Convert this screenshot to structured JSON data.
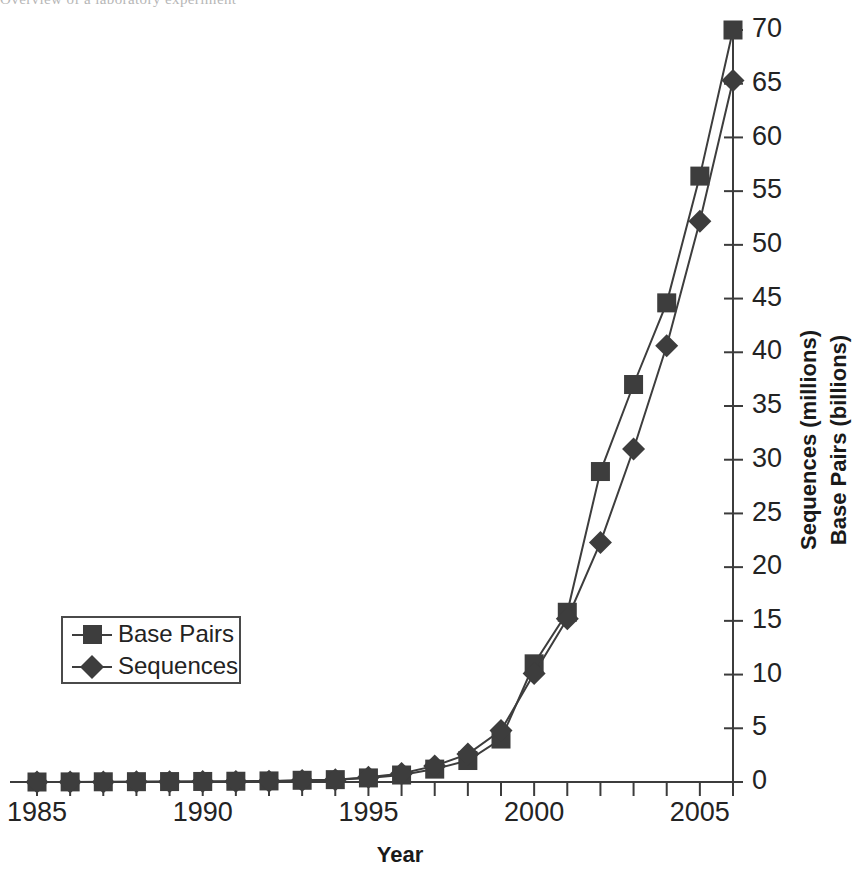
{
  "document_fragment": {
    "clipped_line": "Overview of a laboratory experiment"
  },
  "figure": {
    "name": "genbank-growth-line-chart"
  },
  "axes": {
    "x_title": "Year",
    "y_title_line1": "Sequences (millions)",
    "y_title_line2": "Base Pairs (billions)",
    "x_tick_labels": [
      "1985",
      "1990",
      "1995",
      "2000",
      "2005"
    ],
    "y_tick_labels": [
      "0",
      "5",
      "10",
      "15",
      "20",
      "25",
      "30",
      "35",
      "40",
      "45",
      "50",
      "55",
      "60",
      "65",
      "70"
    ]
  },
  "legend": {
    "position": "inside-lower-left",
    "entries": [
      {
        "label": "Base Pairs",
        "marker": "square-marker",
        "color": "#3d3d3d"
      },
      {
        "label": "Sequences",
        "marker": "diamond-marker",
        "color": "#3d3d3d"
      }
    ]
  },
  "colors": {
    "series": "#3d3d3d",
    "axis": "#3c3c3c",
    "text": "#232323",
    "background": "#ffffff"
  },
  "chart_data": {
    "type": "line",
    "title": "",
    "subtitle": "",
    "xlabel": "Year",
    "ylabel": "Sequences (millions) / Base Pairs (billions)",
    "xlim": [
      1985,
      2006
    ],
    "ylim": [
      0,
      70
    ],
    "y_axis_side": "right",
    "y_tick_step": 5,
    "grid": false,
    "legend_position": "inside-lower-left",
    "x": [
      1985,
      1986,
      1987,
      1988,
      1989,
      1990,
      1991,
      1992,
      1993,
      1994,
      1995,
      1996,
      1997,
      1998,
      1999,
      2000,
      2001,
      2002,
      2003,
      2004,
      2005,
      2006
    ],
    "series": [
      {
        "name": "Base Pairs",
        "unit": "billions",
        "marker": "square",
        "values": [
          0.0,
          0.01,
          0.02,
          0.03,
          0.04,
          0.05,
          0.07,
          0.1,
          0.16,
          0.22,
          0.38,
          0.65,
          1.2,
          2.0,
          4.0,
          11.0,
          15.8,
          28.9,
          37.0,
          44.6,
          56.4,
          70.0
        ]
      },
      {
        "name": "Sequences",
        "unit": "millions",
        "marker": "diamond",
        "values": [
          0.0,
          0.01,
          0.01,
          0.02,
          0.03,
          0.04,
          0.05,
          0.08,
          0.14,
          0.2,
          0.45,
          0.8,
          1.5,
          2.6,
          4.8,
          10.1,
          15.2,
          22.3,
          31.0,
          40.6,
          52.2,
          65.3
        ]
      }
    ]
  },
  "geometry": {
    "x_first_px": 37,
    "x_last_px": 733,
    "y_zero_px": 782,
    "y_top_px": 30
  }
}
